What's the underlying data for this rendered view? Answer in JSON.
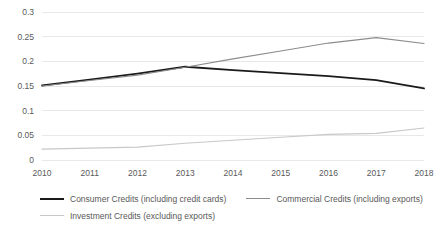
{
  "chart_data": {
    "type": "line",
    "title": "",
    "subtitle": "",
    "xlabel": "",
    "ylabel": "",
    "categories": [
      "2010",
      "2011",
      "2012",
      "2013",
      "2014",
      "2015",
      "2016",
      "2017",
      "2018"
    ],
    "x": [
      2010,
      2011,
      2012,
      2013,
      2014,
      2015,
      2016,
      2017,
      2018
    ],
    "ylim": [
      0,
      0.3
    ],
    "yticks": [
      "0",
      "0.05",
      "0.1",
      "0.15",
      "0.2",
      "0.25",
      "0.3"
    ],
    "ytick_values": [
      0,
      0.05,
      0.1,
      0.15,
      0.2,
      0.25,
      0.3
    ],
    "grid": true,
    "grid_axis": "y",
    "legend_position": "bottom",
    "series": [
      {
        "name": "Consumer Credits (including credit cards)",
        "color": "#1a1a1a",
        "width": 1.8,
        "values": [
          0.151,
          0.163,
          0.175,
          0.189,
          0.182,
          0.176,
          0.17,
          0.162,
          0.145
        ]
      },
      {
        "name": "Commercial Credits (including exports)",
        "color": "#8c8c8c",
        "width": 1.1,
        "values": [
          0.15,
          0.161,
          0.172,
          0.188,
          0.205,
          0.221,
          0.237,
          0.248,
          0.236
        ]
      },
      {
        "name": "Investment Credits (excluding exports)",
        "color": "#c8c8c8",
        "width": 1.1,
        "values": [
          0.022,
          0.024,
          0.026,
          0.034,
          0.04,
          0.046,
          0.052,
          0.054,
          0.065
        ]
      }
    ]
  },
  "axes": {
    "ytick_labels": [
      "0.3",
      "0.25",
      "0.2",
      "0.15",
      "0.1",
      "0.05",
      "0"
    ],
    "xtick_labels": [
      "2010",
      "2011",
      "2012",
      "2013",
      "2014",
      "2015",
      "2016",
      "2017",
      "2018"
    ]
  },
  "legend": {
    "row1": [
      {
        "label": "Consumer Credits (including credit cards)",
        "color": "#1a1a1a",
        "width": "2.2px"
      },
      {
        "label": "Commercial Credits (including exports)",
        "color": "#8c8c8c",
        "width": "1.3px"
      }
    ],
    "row2": [
      {
        "label": "Investment Credits (excluding exports)",
        "color": "#c8c8c8",
        "width": "1.3px"
      }
    ]
  },
  "colors": {
    "grid": "#e8e8e8",
    "axis_text": "#595959",
    "background": "#ffffff"
  }
}
